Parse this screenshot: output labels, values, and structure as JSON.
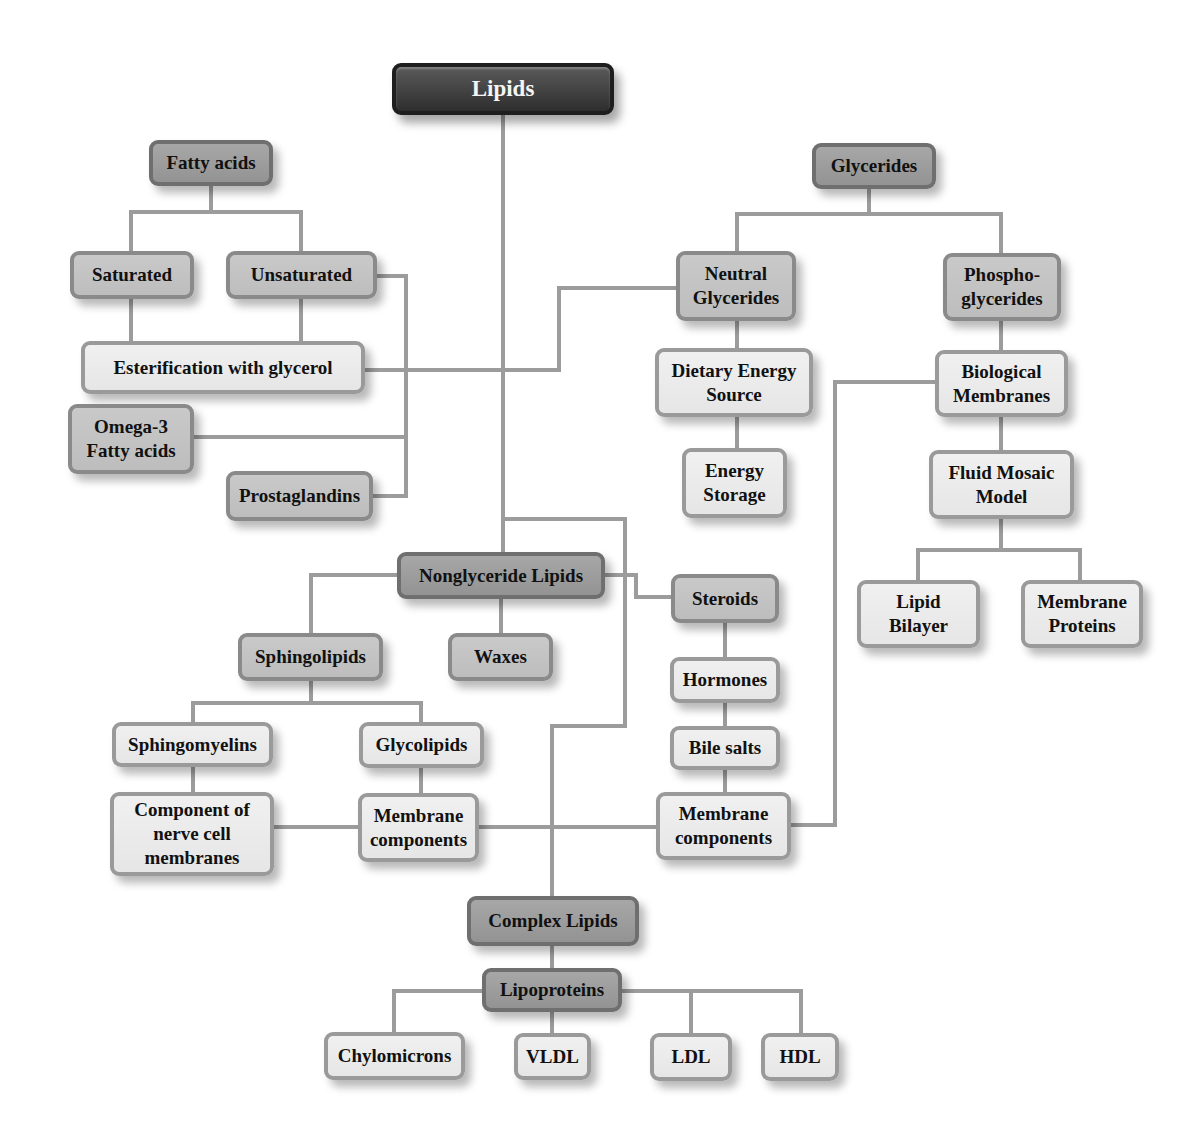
{
  "diagram": {
    "title": "Lipids",
    "connector_color": "#9c9c9c",
    "colors": {
      "root": "#3c3c3c",
      "category": "#9e9e9e",
      "subcategory": "#c4c4c4",
      "leaf": "#ebebeb"
    },
    "nodes": {
      "lipids": "Lipids",
      "fatty_acids": "Fatty acids",
      "saturated": "Saturated",
      "unsaturated": "Unsaturated",
      "esterification": "Esterification with glycerol",
      "omega3": "Omega-3\nFatty acids",
      "prostaglandins": "Prostaglandins",
      "glycerides": "Glycerides",
      "neutral_glycerides": "Neutral\nGlycerides",
      "phosphoglycerides": "Phospho-\nglycerides",
      "dietary_energy": "Dietary Energy\nSource",
      "energy_storage": "Energy\nStorage",
      "biological_membranes": "Biological\nMembranes",
      "fluid_mosaic": "Fluid Mosaic\nModel",
      "lipid_bilayer": "Lipid\nBilayer",
      "membrane_proteins": "Membrane\nProteins",
      "nonglyceride": "Nonglyceride Lipids",
      "sphingolipids": "Sphingolipids",
      "waxes": "Waxes",
      "steroids": "Steroids",
      "hormones": "Hormones",
      "bile_salts": "Bile salts",
      "steroid_membrane_components": "Membrane\ncomponents",
      "sphingomyelins": "Sphingomyelins",
      "glycolipids": "Glycolipids",
      "nerve_cell": "Component of\nnerve cell\nmembranes",
      "glyco_membrane_components": "Membrane\ncomponents",
      "complex_lipids": "Complex Lipids",
      "lipoproteins": "Lipoproteins",
      "chylomicrons": "Chylomicrons",
      "vldl": "VLDL",
      "ldl": "LDL",
      "hdl": "HDL"
    },
    "edges": [
      [
        "lipids",
        "nonglyceride"
      ],
      [
        "lipids",
        "esterification"
      ],
      [
        "fatty_acids",
        "saturated"
      ],
      [
        "fatty_acids",
        "unsaturated"
      ],
      [
        "saturated",
        "esterification"
      ],
      [
        "unsaturated",
        "esterification"
      ],
      [
        "unsaturated",
        "omega3"
      ],
      [
        "unsaturated",
        "prostaglandins"
      ],
      [
        "esterification",
        "neutral_glycerides"
      ],
      [
        "glycerides",
        "neutral_glycerides"
      ],
      [
        "glycerides",
        "phosphoglycerides"
      ],
      [
        "neutral_glycerides",
        "dietary_energy"
      ],
      [
        "dietary_energy",
        "energy_storage"
      ],
      [
        "phosphoglycerides",
        "biological_membranes"
      ],
      [
        "biological_membranes",
        "fluid_mosaic"
      ],
      [
        "fluid_mosaic",
        "lipid_bilayer"
      ],
      [
        "fluid_mosaic",
        "membrane_proteins"
      ],
      [
        "biological_membranes",
        "steroid_membrane_components"
      ],
      [
        "nonglyceride",
        "sphingolipids"
      ],
      [
        "nonglyceride",
        "waxes"
      ],
      [
        "nonglyceride",
        "steroids"
      ],
      [
        "steroids",
        "hormones"
      ],
      [
        "hormones",
        "bile_salts"
      ],
      [
        "bile_salts",
        "steroid_membrane_components"
      ],
      [
        "sphingolipids",
        "sphingomyelins"
      ],
      [
        "sphingolipids",
        "glycolipids"
      ],
      [
        "sphingomyelins",
        "nerve_cell"
      ],
      [
        "glycolipids",
        "glyco_membrane_components"
      ],
      [
        "nerve_cell",
        "glyco_membrane_components"
      ],
      [
        "glyco_membrane_components",
        "steroid_membrane_components"
      ],
      [
        "lipids",
        "complex_lipids"
      ],
      [
        "complex_lipids",
        "lipoproteins"
      ],
      [
        "lipoproteins",
        "chylomicrons"
      ],
      [
        "lipoproteins",
        "vldl"
      ],
      [
        "lipoproteins",
        "ldl"
      ],
      [
        "lipoproteins",
        "hdl"
      ]
    ]
  }
}
